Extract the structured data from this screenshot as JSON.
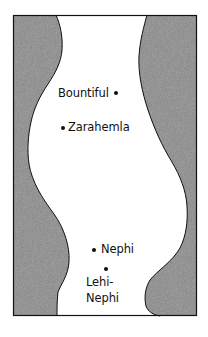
{
  "map": {
    "frame": {
      "x": 13,
      "y": 15,
      "width": 184,
      "height": 301
    },
    "colors": {
      "land": "#8a8a8a",
      "land_grain": "#6f6f6f",
      "sea": "#ffffff",
      "outline": "#111111",
      "text": "#111111"
    },
    "places": [
      {
        "name": "Bountiful",
        "label": "Bountiful",
        "dot": {
          "x": 116,
          "y": 93
        },
        "label_pos": {
          "x": 58,
          "y": 88
        }
      },
      {
        "name": "Zarahemla",
        "label": "Zarahemla",
        "dot": {
          "x": 63,
          "y": 128
        },
        "label_pos": {
          "x": 68,
          "y": 122
        }
      },
      {
        "name": "Nephi",
        "label": "Nephi",
        "dot": {
          "x": 94,
          "y": 250
        },
        "label_pos": {
          "x": 101,
          "y": 244
        }
      },
      {
        "name": "Lehi-Nephi",
        "label_line1": "Lehi-",
        "label_line2": "Nephi",
        "dot": {
          "x": 106,
          "y": 269
        },
        "label_pos": {
          "x": 86,
          "y": 276
        }
      }
    ]
  }
}
